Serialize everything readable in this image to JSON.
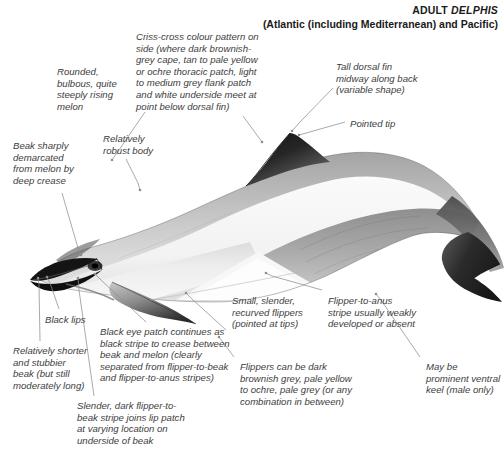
{
  "header": {
    "taxon_prefix": "ADULT ",
    "taxon_species": "DELPHIS",
    "range": "(Atlantic (including Mediterranean) and Pacific)"
  },
  "subject": {
    "name": "common-dolphin",
    "description": "Lateral view of an adult common dolphin showing criss-cross (hourglass) flank pattern"
  },
  "annotations": [
    {
      "id": "melon",
      "text": "Rounded,\nbulbous, quite\nsteeply rising\nmelon",
      "x": 57,
      "y": 66,
      "align": "left"
    },
    {
      "id": "criss-cross",
      "text": "Criss-cross colour pattern on\nside (where dark brownish-\ngrey cape, tan to pale yellow\nor ochre thoracic patch, light\nto medium grey flank patch\nand white underside meet at\npoint below dorsal fin)",
      "x": 136,
      "y": 31,
      "align": "left"
    },
    {
      "id": "dorsal-fin",
      "text": "Tall dorsal fin\nmidway along back\n(variable shape)",
      "x": 336,
      "y": 61,
      "align": "left"
    },
    {
      "id": "pointed-tip",
      "text": "Pointed tip",
      "x": 350,
      "y": 118,
      "align": "left"
    },
    {
      "id": "beak-crease",
      "text": "Beak sharply\ndemarcated\nfrom melon by\ndeep crease",
      "x": 13,
      "y": 140,
      "align": "left"
    },
    {
      "id": "robust-body",
      "text": "Relatively\nrobust body",
      "x": 103,
      "y": 133,
      "align": "left"
    },
    {
      "id": "black-lips",
      "text": "Black lips",
      "x": 45,
      "y": 314,
      "align": "left"
    },
    {
      "id": "short-beak",
      "text": "Relatively shorter\nand stubbier\nbeak (but still\nmoderately long)",
      "x": 13,
      "y": 345,
      "align": "left"
    },
    {
      "id": "eye-patch",
      "text": "Black eye patch continues as\nblack stripe to crease between\nbeak and melon (clearly\nseparated from flipper-to-beak\nand flipper-to-anus stripes)",
      "x": 100,
      "y": 326,
      "align": "left"
    },
    {
      "id": "lip-patch-stripe",
      "text": "Slender, dark flipper-to-\nbeak stripe joins lip patch\nat varying location on\nunderside of beak",
      "x": 77,
      "y": 400,
      "align": "left"
    },
    {
      "id": "flippers-shape",
      "text": "Small, slender,\nrecurved flippers\n(pointed at tips)",
      "x": 232,
      "y": 295,
      "align": "left"
    },
    {
      "id": "flipper-anus-stripe",
      "text": "Flipper-to-anus\nstripe usually weakly\ndeveloped or absent",
      "x": 328,
      "y": 295,
      "align": "left"
    },
    {
      "id": "flipper-colour",
      "text": "Flippers can be dark\nbrownish grey, pale yellow\nto ochre, pale grey (or any\ncombination in between)",
      "x": 240,
      "y": 361,
      "align": "left"
    },
    {
      "id": "ventral-keel",
      "text": "May be\nprominent ventral\nkeel (male only)",
      "x": 426,
      "y": 361,
      "align": "left"
    }
  ],
  "leaders": [
    {
      "id": "melon-leader",
      "points": "145,112 119,150 112,160"
    },
    {
      "id": "criss-cross-leader",
      "points": "243,116 262,142"
    },
    {
      "id": "dorsal-fin-leader",
      "points": "333,88 300,122 292,131"
    },
    {
      "id": "pointed-tip-leader",
      "points": "345,122 299,135"
    },
    {
      "id": "beak-crease-leader",
      "points": "62,193 78,248 81,255"
    },
    {
      "id": "robust-body-leader",
      "points": "126,159 138,183 140,190"
    },
    {
      "id": "black-lips-leader",
      "points": "59,309 50,283 47,277"
    },
    {
      "id": "short-beak-leader",
      "points": "40,341 39,285 38,278"
    },
    {
      "id": "eye-patch-leader",
      "points": "146,322 101,280 95,274"
    },
    {
      "id": "lip-patch-leader",
      "points": "94,396 79,290 78,278"
    },
    {
      "id": "flippers-leader",
      "points": "226,330 192,299 186,293"
    },
    {
      "id": "flipper-anus-leader",
      "points": "322,290 272,276 266,273"
    },
    {
      "id": "flipper-colour-leader",
      "points": "234,357 219,337"
    },
    {
      "id": "ventral-keel-leader",
      "points": "420,357 381,300 376,294"
    }
  ],
  "colors": {
    "background": "#ffffff",
    "text": "#3d3d3d",
    "header_text": "#1a1a1a",
    "leader_line": "#8d8d8d",
    "cape_dark": "#2b2b2b",
    "cape_mid": "#4a4a4a",
    "flank_grey": "#a8a8a8",
    "thoracic_pale": "#ededed",
    "belly_white": "#fcfcfc",
    "beak_black": "#121212"
  }
}
